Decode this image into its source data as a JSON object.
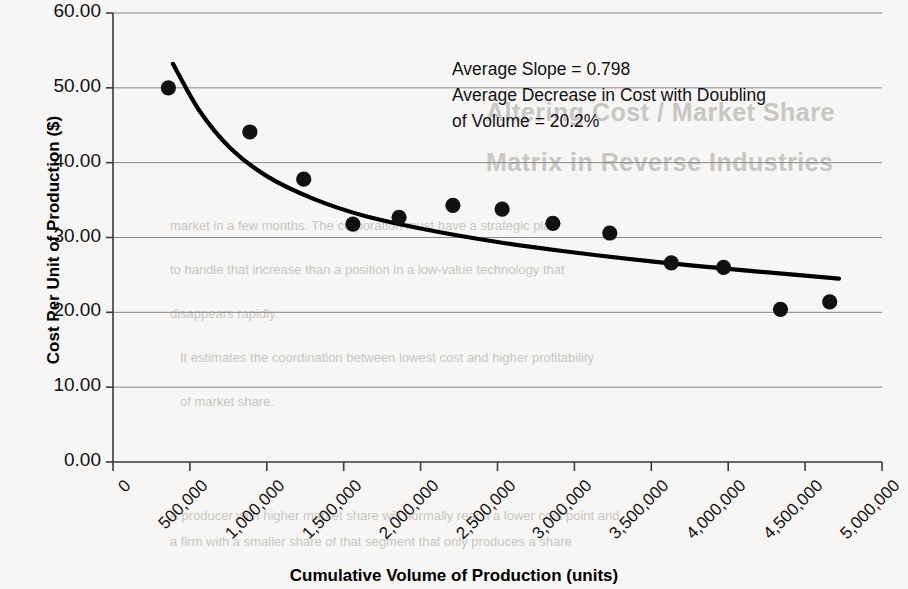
{
  "chart_data": {
    "type": "scatter",
    "title": "",
    "xlabel": "Cumulative Volume of Production (units)",
    "ylabel": "Cost Per Unit of Production ($)",
    "xlim": [
      0,
      5000000
    ],
    "ylim": [
      0,
      60
    ],
    "grid": true,
    "legend": "none",
    "x_ticks": [
      0,
      500000,
      1000000,
      1500000,
      2000000,
      2500000,
      3000000,
      3500000,
      4000000,
      4500000,
      5000000
    ],
    "x_tick_labels": [
      "0",
      "500,000",
      "1,000,000",
      "1,500,000",
      "2,000,000",
      "2,500,000",
      "3,000,000",
      "3,500,000",
      "4,000,000",
      "4,500,000",
      "5,000,000"
    ],
    "y_ticks": [
      0,
      10,
      20,
      30,
      40,
      50,
      60
    ],
    "y_tick_labels": [
      "0.00",
      "10.00",
      "20.00",
      "30.00",
      "40.00",
      "50.00",
      "60.00"
    ],
    "series": [
      {
        "name": "Observed cost per unit",
        "marker": "filled-circle",
        "color": "#111111",
        "points": [
          {
            "x": 360000,
            "y": 50.0
          },
          {
            "x": 890000,
            "y": 44.1
          },
          {
            "x": 1240000,
            "y": 37.8
          },
          {
            "x": 1560000,
            "y": 31.8
          },
          {
            "x": 1860000,
            "y": 32.7
          },
          {
            "x": 2210000,
            "y": 34.3
          },
          {
            "x": 2530000,
            "y": 33.8
          },
          {
            "x": 2860000,
            "y": 31.9
          },
          {
            "x": 3230000,
            "y": 30.6
          },
          {
            "x": 3630000,
            "y": 26.6
          },
          {
            "x": 3970000,
            "y": 26.0
          },
          {
            "x": 4340000,
            "y": 20.4
          },
          {
            "x": 4660000,
            "y": 21.4
          }
        ]
      },
      {
        "name": "Fitted experience curve",
        "marker": "none",
        "color": "#000000",
        "curve": [
          {
            "x": 390000,
            "y": 53.2
          },
          {
            "x": 560000,
            "y": 47.0
          },
          {
            "x": 760000,
            "y": 42.0
          },
          {
            "x": 1000000,
            "y": 38.2
          },
          {
            "x": 1300000,
            "y": 35.2
          },
          {
            "x": 1650000,
            "y": 32.8
          },
          {
            "x": 2050000,
            "y": 31.0
          },
          {
            "x": 2500000,
            "y": 29.4
          },
          {
            "x": 3000000,
            "y": 28.0
          },
          {
            "x": 3500000,
            "y": 26.8
          },
          {
            "x": 4000000,
            "y": 25.8
          },
          {
            "x": 4500000,
            "y": 24.9
          },
          {
            "x": 4720000,
            "y": 24.5
          }
        ]
      }
    ],
    "annotations": [
      "Average Slope = 0.798",
      "Average Decrease in Cost with Doubling",
      "of Volume = 20.2%"
    ]
  },
  "annotation": {
    "line1": "Average Slope = 0.798",
    "line2": "Average Decrease in Cost with Doubling",
    "line3": "of Volume = 20.2%"
  },
  "axes": {
    "y_title": "Cost Per Unit of Production ($)",
    "x_title": "Cumulative Volume of Production (units)"
  },
  "background_text": {
    "heading_line1": "Altering Cost / Market Share",
    "heading_line2": "Matrix in Reverse Industries",
    "body_line1": "market in a few months. The corporation must have a strategic plan",
    "body_line2": "to handle that increase than a position in a low-value technology that",
    "body_line3": "disappears rapidly.",
    "body_line4": "It estimates the coordination between lowest cost and higher profitability",
    "body_line5": "of market share.",
    "body_line6": "A producer with higher market share will normally reach a lower cost point and",
    "body_line7": "a firm with a smaller share of that segment that only produces a share"
  },
  "colors": {
    "marker": "#111111",
    "curve": "#000000",
    "grid": "#8a8a8a",
    "axis": "#3a3a3a",
    "page": "#f7f6f4",
    "bleed": "#c9c7c4"
  }
}
